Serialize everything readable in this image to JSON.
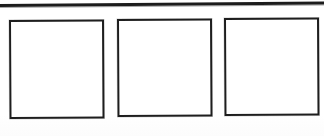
{
  "page": {
    "background_color": "#fefefe",
    "width": 324,
    "height": 136
  },
  "rule": {
    "name": "horizontal-rule",
    "color": "#1c1c1c",
    "thickness_px": 3
  },
  "boxes": {
    "border_color": "#1e1e1e",
    "fill_color": "#ffffff",
    "border_width_px": 2,
    "count": 3,
    "items": [
      {
        "label": "",
        "value": ""
      },
      {
        "label": "",
        "value": ""
      },
      {
        "label": "",
        "value": ""
      }
    ]
  }
}
